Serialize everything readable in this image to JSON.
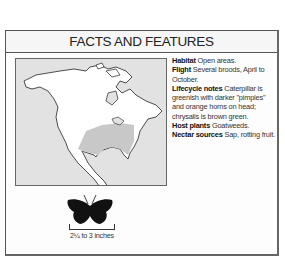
{
  "title": "FACTS AND FEATURES",
  "facts": [
    {
      "label": "Habitat",
      "text": "Open areas."
    },
    {
      "label": "Flight",
      "text": "Several broods, April to October."
    },
    {
      "label": "Lifecycle notes",
      "text": "Caterpillar is greenish with darker \"pimples\" and orange horns on head; chrysalis is brown green."
    },
    {
      "label": "Host plants",
      "text": "Goatweeds."
    },
    {
      "label": "Nectar sources",
      "text": "Sap, rotting fruit."
    }
  ],
  "map": {
    "description": "North America range map",
    "land_color": "#ffffff",
    "water_color": "#e2e2e2",
    "range_color": "#c8c8c8"
  },
  "wingspan": "2¼ to 3 inches"
}
